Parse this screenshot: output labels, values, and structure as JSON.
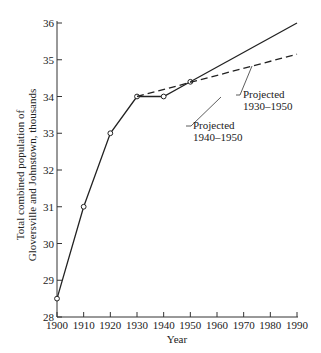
{
  "chart_data": {
    "type": "line",
    "title": "",
    "xlabel": "Year",
    "ylabel_line1": "Total combined population of",
    "ylabel_line2": "Gloversville and Johnstown, thousands",
    "xlim": [
      1900,
      1990
    ],
    "ylim": [
      28,
      36
    ],
    "x_ticks": [
      "1900",
      "1910",
      "1920",
      "1930",
      "1940",
      "1950",
      "1960",
      "1970",
      "1980",
      "1990"
    ],
    "y_ticks": [
      "28",
      "29",
      "30",
      "31",
      "32",
      "33",
      "34",
      "35",
      "36"
    ],
    "grid": false,
    "series": [
      {
        "name": "Observed",
        "style": "solid-markers",
        "x": [
          1900,
          1910,
          1920,
          1930,
          1940,
          1950
        ],
        "values": [
          28.5,
          31,
          33,
          34,
          34,
          34.4
        ]
      },
      {
        "name": "Projected 1940-1950",
        "style": "solid",
        "x": [
          1950,
          1990
        ],
        "values": [
          34.4,
          36.0
        ]
      },
      {
        "name": "Projected 1930-1950",
        "style": "dashed",
        "x": [
          1930,
          1990
        ],
        "values": [
          34.0,
          35.15
        ]
      }
    ],
    "annotations": [
      {
        "line1": "Projected",
        "line2": "1940–1950"
      },
      {
        "line1": "Projected",
        "line2": "1930–1950"
      }
    ]
  }
}
